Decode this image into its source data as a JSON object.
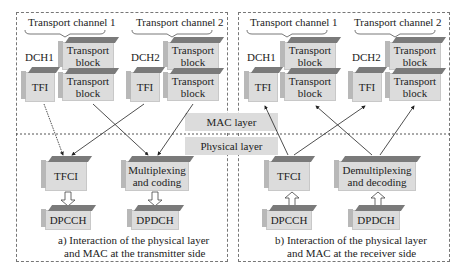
{
  "diagram": {
    "left_panel": {
      "channel1": "Transport channel 1",
      "channel2": "Transport channel 2",
      "dch1": "DCH1",
      "dch2": "DCH2",
      "tfi": "TFI",
      "transport_block": "Transport block",
      "tfci": "TFCI",
      "mux": "Multiplexing and coding",
      "dpcch": "DPCCH",
      "dpdch": "DPDCH",
      "caption_line1": "a) Interaction of the physical layer",
      "caption_line2": "and MAC at the transmitter side"
    },
    "right_panel": {
      "channel1": "Transport channel 1",
      "channel2": "Transport channel 2",
      "dch1": "DCH1",
      "dch2": "DCH2",
      "tfi": "TFI",
      "transport_block": "Transport block",
      "tfci": "TFCI",
      "demux": "Demultiplexing and decoding",
      "dpcch": "DPCCH",
      "dpdch": "DPDCH",
      "caption_line1": "b) Interaction of the physical layer",
      "caption_line2": "and MAC at the receiver side"
    },
    "mac_layer": "MAC layer",
    "physical_layer": "Physical layer"
  }
}
